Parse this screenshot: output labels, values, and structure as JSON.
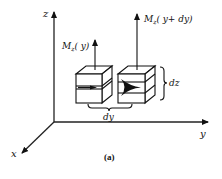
{
  "figure": {
    "caption": "(a)",
    "axes": {
      "z_label": "z",
      "y_label": "y",
      "x_label": "x"
    },
    "moments": {
      "left_label": "M",
      "left_sub": "z",
      "left_arg": "( y)",
      "right_label": "M",
      "right_sub": "z",
      "right_arg": "( y+ dy)"
    },
    "dimensions": {
      "height_label": "dz",
      "width_label": "dy"
    },
    "colors": {
      "ink": "#111111",
      "background": "#ffffff"
    }
  }
}
